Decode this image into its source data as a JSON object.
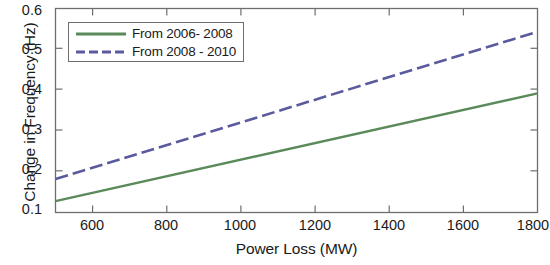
{
  "chart_data": {
    "type": "line",
    "title": "",
    "xlabel": "Power Loss (MW)",
    "ylabel": "Change in Frequency (Hz)",
    "xlim": [
      500,
      1800
    ],
    "ylim": [
      0.1,
      0.6
    ],
    "xticks": [
      600,
      800,
      1000,
      1200,
      1400,
      1600,
      1800
    ],
    "xtick_labels": [
      "600",
      "800",
      "1000",
      "1200",
      "1400",
      "1600",
      "1800"
    ],
    "yticks": [
      0.1,
      0.2,
      0.3,
      0.4,
      0.5,
      0.6
    ],
    "ytick_labels": [
      "0.1",
      "0.2",
      "0.3",
      "0.4",
      "0.5",
      "0.6"
    ],
    "grid": false,
    "legend_position": "upper left",
    "series": [
      {
        "name": "From 2006- 2008",
        "color": "#5a8a5a",
        "style": "solid",
        "x": [
          500,
          1800
        ],
        "values": [
          0.128,
          0.392
        ]
      },
      {
        "name": "From 2008 - 2010",
        "color": "#5b5a9e",
        "style": "dashdot",
        "x": [
          500,
          1800
        ],
        "values": [
          0.182,
          0.543
        ]
      }
    ]
  },
  "legend": {
    "entries": [
      {
        "label": "From 2006- 2008"
      },
      {
        "label": "From 2008 - 2010"
      }
    ]
  }
}
